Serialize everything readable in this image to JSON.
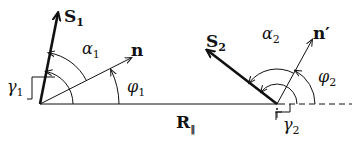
{
  "diagram": {
    "type": "vector-geometry",
    "labels": {
      "s1": "S",
      "s1_sub": "1",
      "n": "n",
      "alpha1": "α",
      "alpha1_sub": "1",
      "phi1": "φ",
      "phi1_sub": "1",
      "gamma1": "γ",
      "gamma1_sub": "1",
      "r_parallel": "R",
      "r_parallel_sub": "‖",
      "s2": "S",
      "s2_sub": "2",
      "n_prime": "n′",
      "alpha2": "α",
      "alpha2_sub": "2",
      "phi2": "φ",
      "phi2_sub": "2",
      "gamma2": "γ",
      "gamma2_sub": "2"
    },
    "colors": {
      "stroke": "#111111",
      "background": "#ffffff"
    }
  }
}
